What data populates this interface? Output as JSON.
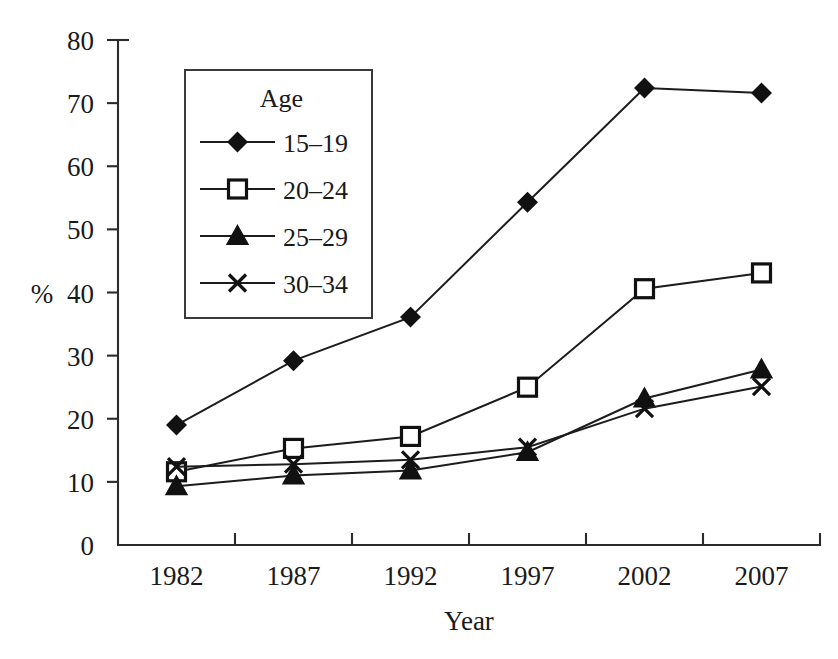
{
  "chart_data": {
    "type": "line",
    "title": "",
    "xlabel": "Year",
    "ylabel": "%",
    "categories": [
      "1982",
      "1987",
      "1992",
      "1997",
      "2002",
      "2007"
    ],
    "x_tick_labels": [
      "1982",
      "1987",
      "1992",
      "1997",
      "2002",
      "2007"
    ],
    "y_tick_labels": [
      "0",
      "10",
      "20",
      "30",
      "40",
      "50",
      "60",
      "70",
      "80"
    ],
    "y_ticks": [
      0,
      10,
      20,
      30,
      40,
      50,
      60,
      70,
      80
    ],
    "ylim": [
      0,
      80
    ],
    "grid": false,
    "legend_title": "Age",
    "legend_position": "upper-left-inside",
    "series": [
      {
        "name": "15–19",
        "marker": "filled-diamond",
        "values": [
          19.0,
          29.2,
          36.1,
          54.3,
          72.4,
          71.6
        ]
      },
      {
        "name": "20–24",
        "marker": "open-square",
        "values": [
          11.6,
          15.3,
          17.2,
          25.0,
          40.6,
          43.1
        ]
      },
      {
        "name": "25–29",
        "marker": "filled-triangle",
        "values": [
          9.3,
          11.0,
          11.8,
          14.7,
          23.2,
          27.8
        ]
      },
      {
        "name": "30–34",
        "marker": "cross",
        "values": [
          12.4,
          12.8,
          13.5,
          15.5,
          21.6,
          25.1
        ]
      }
    ]
  },
  "legend": {
    "title": "Age",
    "entries": [
      {
        "label": "15–19",
        "marker": "filled-diamond"
      },
      {
        "label": "20–24",
        "marker": "open-square"
      },
      {
        "label": "25–29",
        "marker": "filled-triangle"
      },
      {
        "label": "30–34",
        "marker": "cross"
      }
    ]
  },
  "axes": {
    "y_axis_label": "%",
    "x_axis_label": "Year"
  },
  "colors": {
    "line": "#1c1c1c",
    "marker_fill": "#111111",
    "marker_open_fill": "#ffffff",
    "axis": "#2b2b2b",
    "text": "#1a1a1a",
    "background": "#ffffff"
  }
}
